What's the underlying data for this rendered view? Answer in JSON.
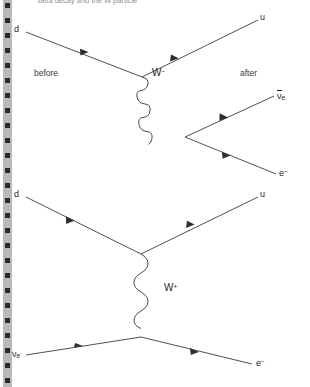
{
  "page": {
    "width": 310,
    "height": 387,
    "background": "#ffffff",
    "line_color": "#3d3d3d",
    "text_color": "#262626",
    "strip_color": "#b9b9b9",
    "hole_color": "#2b2b2b",
    "header_text": "beta decay and the W particle"
  },
  "sprocket": {
    "name": "page-edge-perforation-strip",
    "hole_count": 26,
    "hole_spacing": 15
  },
  "diagram1": {
    "title": "beta-minus decay vertex diagram",
    "stage_before": "before",
    "stage_after": "after",
    "boson_label": "W",
    "boson_charge": "−",
    "incoming": [
      {
        "name": "down-quark",
        "label": "d"
      }
    ],
    "outgoing": [
      {
        "name": "up-quark",
        "label": "u"
      },
      {
        "name": "electron-antineutrino",
        "label": "ν",
        "sub": "e",
        "overline": true
      },
      {
        "name": "electron",
        "label": "e",
        "sup": "−"
      }
    ]
  },
  "diagram2": {
    "title": "neutrino scattering exchange diagram",
    "boson_label": "W",
    "boson_charge": "+",
    "incoming": [
      {
        "name": "down-quark",
        "label": "d"
      },
      {
        "name": "electron-neutrino",
        "label": "ν",
        "sub": "e"
      }
    ],
    "outgoing": [
      {
        "name": "up-quark",
        "label": "u"
      },
      {
        "name": "electron",
        "label": "e",
        "sup": "−"
      }
    ]
  }
}
